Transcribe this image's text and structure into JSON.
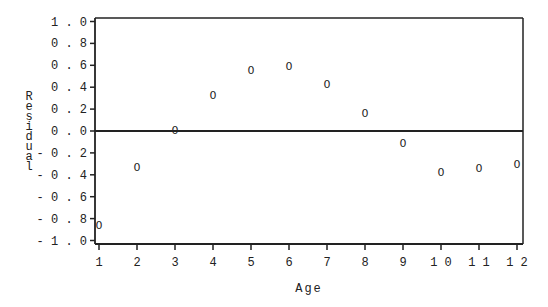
{
  "chart_data": {
    "type": "scatter",
    "title": "",
    "xlabel": "Age",
    "ylabel": "Residual",
    "marker": "0",
    "x": [
      1,
      2,
      3,
      4,
      5,
      6,
      7,
      8,
      9,
      10,
      11,
      12
    ],
    "series": [
      {
        "name": "Residual",
        "values": [
          -0.86,
          -0.33,
          0.01,
          0.33,
          0.56,
          0.59,
          0.43,
          0.16,
          -0.11,
          -0.37,
          -0.34,
          -0.3
        ]
      }
    ],
    "xticks": [
      "1",
      "2",
      "3",
      "4",
      "5",
      "6",
      "7",
      "8",
      "9",
      "10",
      "11",
      "12"
    ],
    "yticks": [
      "1.0",
      "0.8",
      "0.6",
      "0.4",
      "0.2",
      "0.0",
      "-0.2",
      "-0.4",
      "-0.6",
      "-0.8",
      "-1.0"
    ],
    "ylim": [
      -1.0,
      1.0
    ],
    "xlim": [
      1,
      12
    ],
    "reference_line_y": 0.0,
    "grid": false,
    "legend": null
  }
}
